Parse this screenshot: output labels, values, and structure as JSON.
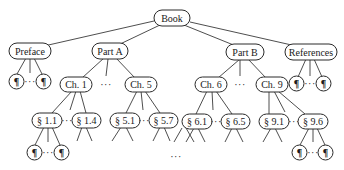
{
  "diagram": {
    "type": "tree",
    "colors": {
      "stroke": "#2a2a2a",
      "edge": "#3a3a3a",
      "fill": "#ffffff",
      "text": "#1a1a1a"
    },
    "nodes": {
      "book": "Book",
      "preface": "Preface",
      "part_a": "Part A",
      "part_b": "Part B",
      "references": "References",
      "ch1": "Ch. 1",
      "ch5": "Ch. 5",
      "ch6": "Ch. 6",
      "ch9": "Ch. 9",
      "s1_1": "§ 1.1",
      "s1_4": "§ 1.4",
      "s5_1": "§ 5.1",
      "s5_7": "§ 5.7",
      "s6_1": "§ 6.1",
      "s6_5": "§ 6.5",
      "s9_1": "§ 9.1",
      "s9_6": "§ 9.6",
      "paragraph": "¶"
    },
    "ellipsis": "···",
    "structure": {
      "Book": [
        "Preface",
        "Part A",
        "Part B",
        "References"
      ],
      "Preface": [
        "¶",
        "···",
        "¶"
      ],
      "Part A": [
        "Ch. 1",
        "···",
        "Ch. 5"
      ],
      "Part B": [
        "Ch. 6",
        "···",
        "Ch. 9"
      ],
      "References": [
        "¶",
        "···",
        "¶"
      ],
      "Ch. 1": [
        "§ 1.1",
        "···",
        "§ 1.4"
      ],
      "Ch. 5": [
        "§ 5.1",
        "···",
        "§ 5.7"
      ],
      "Ch. 6": [
        "§ 6.1",
        "···",
        "§ 6.5"
      ],
      "Ch. 9": [
        "§ 9.1",
        "···",
        "§ 9.6"
      ],
      "§ 1.1": [
        "¶",
        "···",
        "¶"
      ],
      "§ 9.6": [
        "¶",
        "···",
        "¶"
      ]
    }
  }
}
